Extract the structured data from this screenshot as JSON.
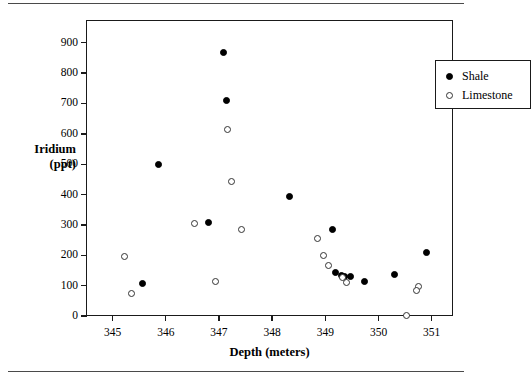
{
  "chart_data": {
    "type": "scatter",
    "title": "",
    "xlabel": "Depth (meters)",
    "ylabel": "Iridium (ppt)",
    "ylabel_line1": "Iridium",
    "ylabel_line2": "(ppt)",
    "xlim": [
      344.5,
      351.4
    ],
    "ylim": [
      0,
      975
    ],
    "grid": false,
    "legend_position": "top-right",
    "xticks": [
      345,
      346,
      347,
      348,
      349,
      350,
      351
    ],
    "xtick_labels": [
      "345",
      "346",
      "347",
      "348",
      "349",
      "350",
      "351"
    ],
    "yticks": [
      0,
      100,
      200,
      300,
      400,
      500,
      600,
      700,
      800,
      900
    ],
    "ytick_labels": [
      "0",
      "100",
      "200",
      "300",
      "400",
      "500",
      "600",
      "700",
      "800",
      "900"
    ],
    "series": [
      {
        "name": "Shale",
        "marker": "filled-circle",
        "color": "#000000",
        "points": [
          {
            "x": 345.55,
            "y": 110
          },
          {
            "x": 345.85,
            "y": 502
          },
          {
            "x": 346.78,
            "y": 312
          },
          {
            "x": 347.06,
            "y": 870
          },
          {
            "x": 347.12,
            "y": 712
          },
          {
            "x": 348.3,
            "y": 396
          },
          {
            "x": 349.12,
            "y": 287
          },
          {
            "x": 349.17,
            "y": 146
          },
          {
            "x": 349.28,
            "y": 138
          },
          {
            "x": 349.34,
            "y": 133
          },
          {
            "x": 349.45,
            "y": 133
          },
          {
            "x": 349.72,
            "y": 117
          },
          {
            "x": 350.28,
            "y": 140
          },
          {
            "x": 350.88,
            "y": 212
          }
        ]
      },
      {
        "name": "Limestone",
        "marker": "open-circle",
        "color": "#333333",
        "points": [
          {
            "x": 345.2,
            "y": 199
          },
          {
            "x": 345.33,
            "y": 77
          },
          {
            "x": 346.52,
            "y": 309
          },
          {
            "x": 346.92,
            "y": 117
          },
          {
            "x": 347.14,
            "y": 618
          },
          {
            "x": 347.21,
            "y": 447
          },
          {
            "x": 347.4,
            "y": 287
          },
          {
            "x": 348.83,
            "y": 257
          },
          {
            "x": 348.95,
            "y": 203
          },
          {
            "x": 349.04,
            "y": 168
          },
          {
            "x": 349.3,
            "y": 131
          },
          {
            "x": 349.37,
            "y": 113
          },
          {
            "x": 350.5,
            "y": 6
          },
          {
            "x": 350.74,
            "y": 102
          },
          {
            "x": 350.7,
            "y": 86
          }
        ]
      }
    ],
    "legend": [
      {
        "label": "Shale",
        "marker": "filled-circle"
      },
      {
        "label": "Limestone",
        "marker": "open-circle"
      }
    ]
  }
}
